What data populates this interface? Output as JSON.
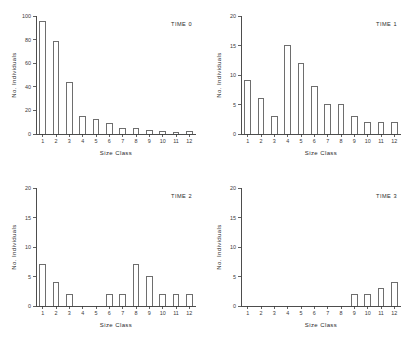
{
  "figure": {
    "background_color": "#ffffff",
    "ink_color": "#3a3a3a",
    "panel_count": 4
  },
  "chart_data": [
    {
      "type": "bar",
      "title": "TIME 0",
      "xlabel": "Size  Class",
      "ylabel": "No. Individuals",
      "categories": [
        "1",
        "2",
        "3",
        "4",
        "5",
        "6",
        "7",
        "8",
        "9",
        "10",
        "11",
        "12"
      ],
      "values": [
        95,
        78,
        44,
        15,
        12,
        9,
        5,
        5,
        3,
        2,
        1.5,
        2
      ],
      "ylim": [
        0,
        100
      ],
      "yticks": [
        0,
        20,
        40,
        60,
        80,
        100
      ],
      "yticklabels": [
        "0",
        "20",
        "40",
        "60",
        "80",
        "100"
      ],
      "grid": false,
      "legend": "none"
    },
    {
      "type": "bar",
      "title": "TIME 1",
      "xlabel": "Size  Class",
      "ylabel": "No. Individuals",
      "categories": [
        "1",
        "2",
        "3",
        "4",
        "5",
        "6",
        "7",
        "8",
        "9",
        "10",
        "11",
        "12"
      ],
      "values": [
        9,
        6,
        3,
        15,
        12,
        8,
        5,
        5,
        3,
        2,
        2,
        2
      ],
      "ylim": [
        0,
        20
      ],
      "yticks": [
        0,
        5,
        10,
        15,
        20
      ],
      "yticklabels": [
        "0",
        "5",
        "10",
        "15",
        "20"
      ],
      "grid": false,
      "legend": "none"
    },
    {
      "type": "bar",
      "title": "TIME 2",
      "xlabel": "Size  Class",
      "ylabel": "No. Individuals",
      "categories": [
        "1",
        "2",
        "3",
        "4",
        "5",
        "6",
        "7",
        "8",
        "9",
        "10",
        "11",
        "12"
      ],
      "values": [
        7,
        4,
        2,
        0,
        0,
        2,
        2,
        7,
        5,
        2,
        2,
        2
      ],
      "ylim": [
        0,
        20
      ],
      "yticks": [
        0,
        5,
        10,
        15,
        20
      ],
      "yticklabels": [
        "0",
        "5",
        "10",
        "15",
        "20"
      ],
      "grid": false,
      "legend": "none"
    },
    {
      "type": "bar",
      "title": "TIME 3",
      "xlabel": "Size  Class",
      "ylabel": "No. Individuals",
      "categories": [
        "1",
        "2",
        "3",
        "4",
        "5",
        "6",
        "7",
        "8",
        "9",
        "10",
        "11",
        "12"
      ],
      "values": [
        0,
        0,
        0,
        0,
        0,
        0,
        0,
        0,
        2,
        2,
        3,
        4
      ],
      "ylim": [
        0,
        20
      ],
      "yticks": [
        0,
        5,
        10,
        15,
        20
      ],
      "yticklabels": [
        "0",
        "5",
        "10",
        "15",
        "20"
      ],
      "grid": false,
      "legend": "none"
    }
  ]
}
